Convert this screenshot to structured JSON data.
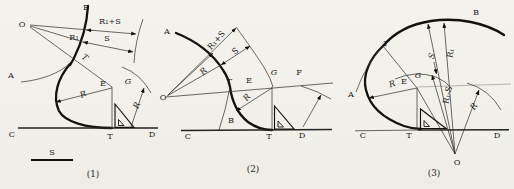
{
  "page": {
    "background": "#f2f1ec",
    "ink": "#1d1b18"
  },
  "fig1": {
    "caption": "(1)",
    "labels": {
      "o": "O",
      "b": "B",
      "r1_plus_s": "R₁+S",
      "r1": "R₁",
      "s": "S",
      "t_curve": "T",
      "a": "A",
      "r_radius": "R",
      "e": "E",
      "g": "G",
      "r_swing": "R",
      "c": "C",
      "t_base": "T",
      "d": "D",
      "scale": "S"
    }
  },
  "fig2": {
    "caption": "(2)",
    "labels": {
      "a": "A",
      "o": "O",
      "r1_plus_s": "R₁+S",
      "s": "S",
      "r_radius": "R",
      "t_curve": "T",
      "e": "E",
      "g": "G",
      "f": "F",
      "r_lower": "R",
      "b": "B",
      "c": "C",
      "t_base": "T",
      "d": "D"
    }
  },
  "fig3": {
    "caption": "(3)",
    "labels": {
      "b": "B",
      "t_curve": "T",
      "s": "S",
      "r1": "R₁",
      "r1_minus_s": "R₁-S",
      "e": "E",
      "g": "G",
      "a": "A",
      "r_radius": "R",
      "r_swing": "R",
      "c": "C",
      "t_base": "T",
      "d": "D",
      "o": "O"
    }
  }
}
